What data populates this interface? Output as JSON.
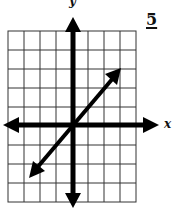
{
  "problem": {
    "number": "5"
  },
  "axes": {
    "x_label": "x",
    "y_label": "y"
  },
  "grid": {
    "columns": 8,
    "rows": 9,
    "left": 8,
    "right": 136,
    "top": 31,
    "bottom": 202,
    "line_color": "#333333"
  },
  "graph": {
    "axis_color": "#000000",
    "line_color": "#000000",
    "x_axis_y": 125,
    "y_axis_x": 73,
    "line_start": [
      29,
      178
    ],
    "line_end": [
      121,
      68
    ]
  }
}
